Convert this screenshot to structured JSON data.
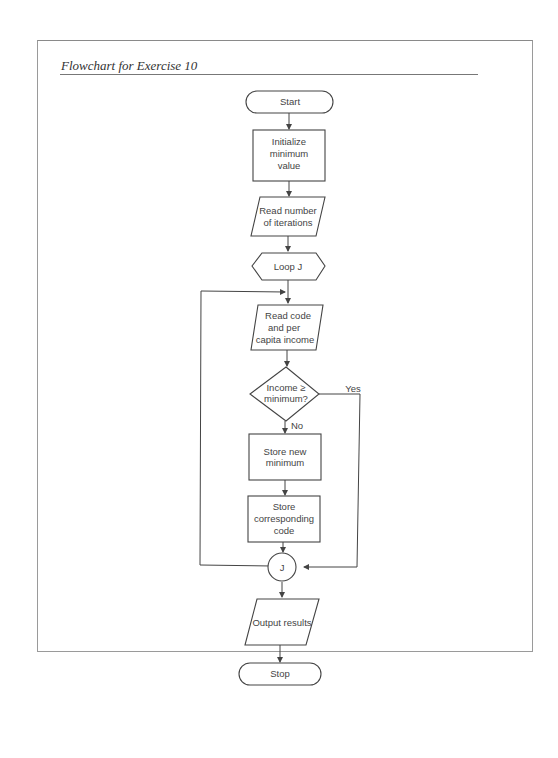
{
  "page": {
    "title": "Flowchart for Exercise 10"
  },
  "flowchart": {
    "nodes": {
      "start": {
        "type": "terminal",
        "label": "Start"
      },
      "init": {
        "type": "process",
        "lines": [
          "Initialize",
          "minimum",
          "value"
        ]
      },
      "read_iterations": {
        "type": "input-output",
        "lines": [
          "Read number",
          "of iterations"
        ]
      },
      "loop": {
        "type": "preparation",
        "label": "Loop J"
      },
      "read_code": {
        "type": "input-output",
        "lines": [
          "Read code",
          "and  per",
          "capita income"
        ]
      },
      "decision": {
        "type": "decision",
        "lines": [
          "Income ≥",
          "minimum?"
        ]
      },
      "store_min": {
        "type": "process",
        "lines": [
          "Store new",
          "minimum"
        ]
      },
      "store_code": {
        "type": "process",
        "lines": [
          "Store",
          "corresponding",
          "code"
        ]
      },
      "connector": {
        "type": "connector",
        "label": "J"
      },
      "output": {
        "type": "input-output",
        "label": "Output results"
      },
      "stop": {
        "type": "terminal",
        "label": "Stop"
      }
    },
    "edge_labels": {
      "yes": "Yes",
      "no": "No"
    }
  }
}
